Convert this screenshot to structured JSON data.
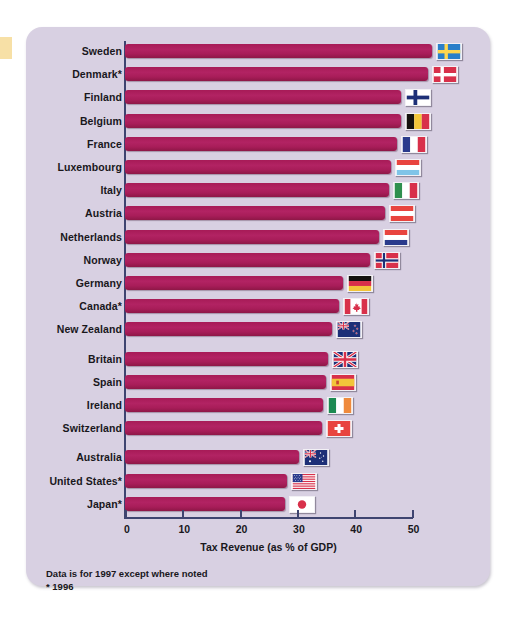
{
  "chart_data": {
    "type": "bar",
    "orientation": "horizontal",
    "title": "",
    "xlabel": "Tax Revenue (as % of GDP)",
    "ylabel": "",
    "xlim": [
      0,
      50
    ],
    "xticks": [
      0,
      10,
      20,
      30,
      40,
      50
    ],
    "xtick_labels": [
      "0",
      "10",
      "20",
      "30",
      "40",
      "50"
    ],
    "grid": false,
    "legend": "none",
    "bar_color": "#a81f5f",
    "categories": [
      "Sweden",
      "Denmark*",
      "Finland",
      "Belgium",
      "France",
      "Luxembourg",
      "Italy",
      "Austria",
      "Netherlands",
      "Norway",
      "Germany",
      "Canada*",
      "New Zealand",
      "Britain",
      "Spain",
      "Ireland",
      "Switzerland",
      "Australia",
      "United States*",
      "Japan*"
    ],
    "values": [
      53.5,
      52.9,
      48.2,
      48.2,
      47.4,
      46.5,
      46.1,
      45.4,
      44.4,
      42.8,
      38.1,
      37.3,
      36.1,
      35.4,
      35.0,
      34.6,
      34.3,
      30.4,
      28.3,
      27.9
    ],
    "rows": [
      {
        "label": "Sweden",
        "value": 53.5,
        "flag": "flag-sweden"
      },
      {
        "label": "Denmark*",
        "value": 52.9,
        "flag": "flag-denmark"
      },
      {
        "label": "Finland",
        "value": 48.2,
        "flag": "flag-finland"
      },
      {
        "label": "Belgium",
        "value": 48.2,
        "flag": "flag-belgium"
      },
      {
        "label": "France",
        "value": 47.4,
        "flag": "flag-france"
      },
      {
        "label": "Luxembourg",
        "value": 46.5,
        "flag": "flag-luxembourg"
      },
      {
        "label": "Italy",
        "value": 46.1,
        "flag": "flag-italy"
      },
      {
        "label": "Austria",
        "value": 45.4,
        "flag": "flag-austria"
      },
      {
        "label": "Netherlands",
        "value": 44.4,
        "flag": "flag-netherlands"
      },
      {
        "label": "Norway",
        "value": 42.8,
        "flag": "flag-norway"
      },
      {
        "label": "Germany",
        "value": 38.1,
        "flag": "flag-germany"
      },
      {
        "label": "Canada*",
        "value": 37.3,
        "flag": "flag-canada"
      },
      {
        "label": "New Zealand",
        "value": 36.1,
        "flag": "flag-new-zealand"
      },
      {
        "label": "Britain",
        "value": 35.4,
        "flag": "flag-britain"
      },
      {
        "label": "Spain",
        "value": 35.0,
        "flag": "flag-spain"
      },
      {
        "label": "Ireland",
        "value": 34.6,
        "flag": "flag-ireland"
      },
      {
        "label": "Switzerland",
        "value": 34.3,
        "flag": "flag-switzerland"
      },
      {
        "label": "Australia",
        "value": 30.4,
        "flag": "flag-australia"
      },
      {
        "label": "United States*",
        "value": 28.3,
        "flag": "flag-united-states"
      },
      {
        "label": "Japan*",
        "value": 27.9,
        "flag": "flag-japan"
      }
    ]
  },
  "footnote": {
    "line1": "Data is for 1997 except where noted",
    "line2": "* 1996"
  },
  "colors": {
    "panel_background": "#d8d0e2",
    "bar": "#a81f5f",
    "axis": "#3e4470",
    "text": "#19171c",
    "left_tab": "#f7e0a6"
  }
}
